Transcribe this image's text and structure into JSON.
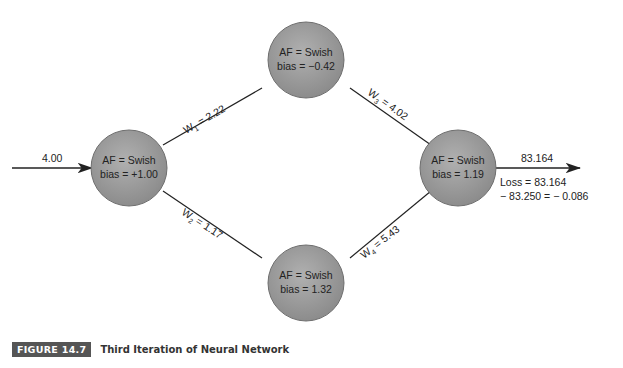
{
  "input": {
    "value": "4.00"
  },
  "nodes": [
    {
      "id": "n1",
      "line1": "AF = Swish",
      "line2": "bias = +1.00"
    },
    {
      "id": "n2",
      "line1": "AF = Swish",
      "line2": "bias = −0.42"
    },
    {
      "id": "n3",
      "line1": "AF = Swish",
      "line2": "bias = 1.32"
    },
    {
      "id": "n4",
      "line1": "AF = Swish",
      "line2": "bias = 1.19"
    }
  ],
  "weights": [
    {
      "sym": "W",
      "sub": "1",
      "val": " = 2.22"
    },
    {
      "sym": "W",
      "sub": "2",
      "val": " = 1.17"
    },
    {
      "sym": "W",
      "sub": "3",
      "val": " = 4.02"
    },
    {
      "sym": "W",
      "sub": "4",
      "val": " = 5.43"
    }
  ],
  "output": {
    "value": "83.164",
    "loss_line1": "Loss = 83.164",
    "loss_line2": "− 83.250 = − 0.086"
  },
  "caption": {
    "badge": "FIGURE 14.7",
    "title": "Third Iteration of Neural Network"
  },
  "colors": {
    "node_fill": "#9a9a9a",
    "node_stroke": "#6e6e6e",
    "badge": "#555555"
  }
}
